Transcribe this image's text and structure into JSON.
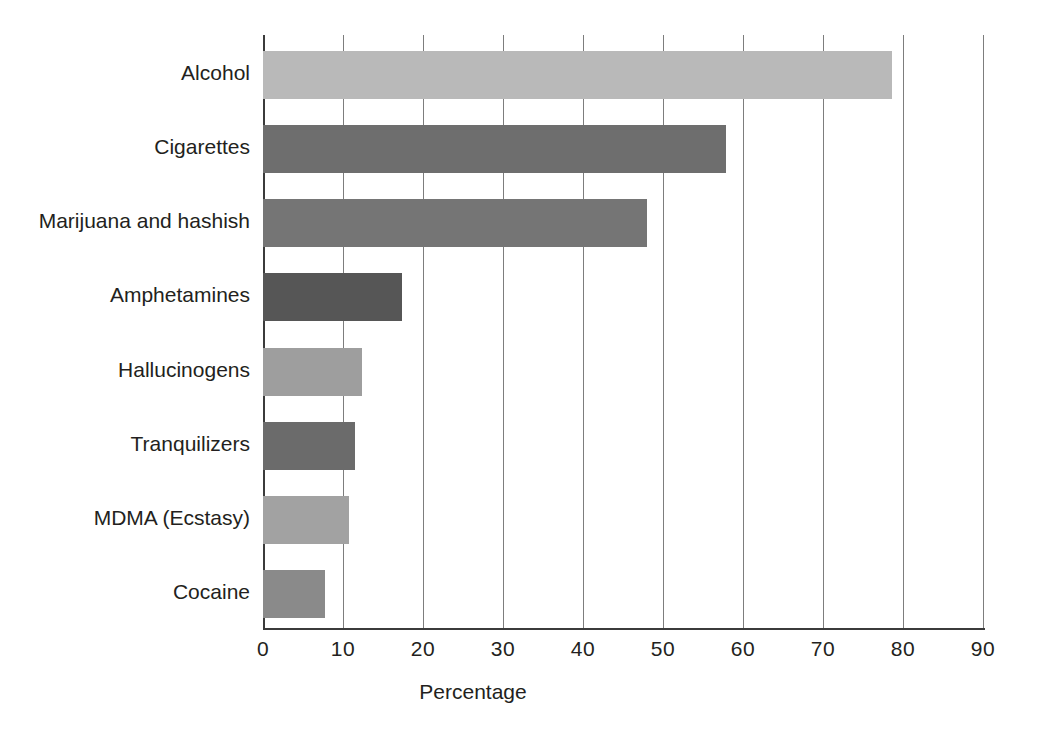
{
  "chart_data": {
    "type": "bar",
    "orientation": "horizontal",
    "title": "",
    "subtitle": "",
    "xlabel": "Percentage",
    "ylabel": "",
    "xlim": [
      0,
      90
    ],
    "ylim": null,
    "xticks": [
      "0",
      "10",
      "20",
      "30",
      "40",
      "50",
      "60",
      "70",
      "80",
      "90"
    ],
    "xtick_values": [
      0,
      10,
      20,
      30,
      40,
      50,
      60,
      70,
      80,
      90
    ],
    "grid": "vertical",
    "legend": null,
    "annotations": [],
    "categories": [
      "Alcohol",
      "Cigarettes",
      "Marijuana and hashish",
      "Amphetamines",
      "Hallucinogens",
      "Tranquilizers",
      "MDMA (Ecstasy)",
      "Cocaine"
    ],
    "values": [
      78.6,
      57.9,
      48.0,
      17.4,
      12.4,
      11.5,
      10.7,
      7.8
    ],
    "bar_colors": [
      "#b9b9b9",
      "#6e6e6e",
      "#757575",
      "#565656",
      "#9e9e9e",
      "#6b6b6b",
      "#a2a2a2",
      "#8a8a8a"
    ],
    "bars": [
      {
        "label": "Alcohol",
        "value": 78.6,
        "color": "#b9b9b9"
      },
      {
        "label": "Cigarettes",
        "value": 57.9,
        "color": "#6e6e6e"
      },
      {
        "label": "Marijuana and hashish",
        "value": 48.0,
        "color": "#757575"
      },
      {
        "label": "Amphetamines",
        "value": 17.4,
        "color": "#565656"
      },
      {
        "label": "Hallucinogens",
        "value": 12.4,
        "color": "#9e9e9e"
      },
      {
        "label": "Tranquilizers",
        "value": 11.5,
        "color": "#6b6b6b"
      },
      {
        "label": "MDMA (Ecstasy)",
        "value": 10.7,
        "color": "#a2a2a2"
      },
      {
        "label": "Cocaine",
        "value": 7.8,
        "color": "#8a8a8a"
      }
    ]
  },
  "axis": {
    "color": "#3b3b3b",
    "gridline_color": "#7d7d7d"
  }
}
